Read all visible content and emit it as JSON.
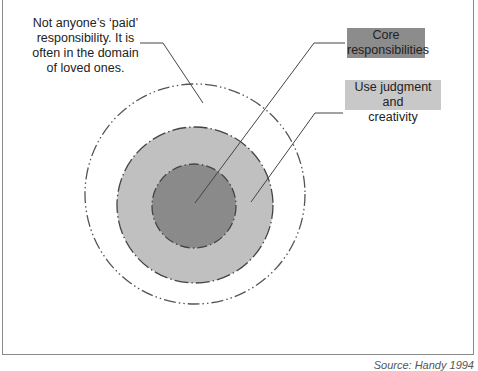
{
  "diagram": {
    "type": "concentric-circles",
    "center": [
      195,
      194
    ],
    "rings": [
      {
        "name": "outer",
        "radius": 110,
        "fill": "#ffffff",
        "label": "Not anyone’s ‘paid’ responsibility. It is often in the domain of loved ones."
      },
      {
        "name": "middle",
        "radius": 77,
        "fill": "#c0c0c0",
        "label": "Use judgment and creativity"
      },
      {
        "name": "inner",
        "radius": 42,
        "fill": "#8a8a8a",
        "label": "Core responsibilities"
      }
    ]
  },
  "labels": {
    "outer_line1": "Not anyone’s ‘paid’",
    "outer_line2": "responsibility. It is",
    "outer_line3": "often in the domain",
    "outer_line4": "of loved ones.",
    "core_line1": "Core",
    "core_line2": "responsibilities",
    "judgment_line1": "Use judgment and",
    "judgment_line2": "creativity"
  },
  "source": "Source: Handy 1994",
  "colors": {
    "inner": "#8a8a8a",
    "middle": "#c0c0c0",
    "frame": "#8a8a8a"
  }
}
